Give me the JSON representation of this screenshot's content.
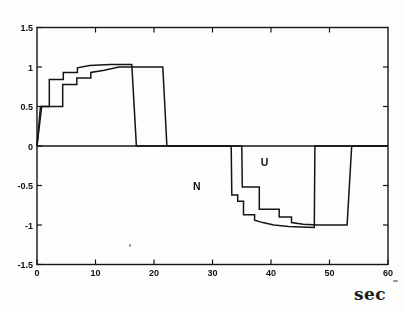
{
  "figure": {
    "xlabel": "sec"
  },
  "chart_data": {
    "type": "line",
    "title": "",
    "xlabel": "sec",
    "ylabel": "",
    "xlim": [
      0,
      60
    ],
    "ylim": [
      -1.5,
      1.5
    ],
    "grid": false,
    "legend_position": "none",
    "zero_line": true,
    "x_ticks": {
      "values": [
        0,
        10,
        20,
        30,
        40,
        50,
        60
      ],
      "labels": [
        "0",
        "10",
        "20",
        "30",
        "40",
        "50",
        "60"
      ]
    },
    "y_ticks": {
      "values": [
        1.5,
        1,
        0.5,
        0,
        -0.5,
        -1,
        -1.5
      ],
      "labels": [
        "1.5",
        "1",
        "0.5",
        "0",
        "-0.5",
        "-1",
        "-1.5"
      ]
    },
    "top_tick_values": [
      10,
      20,
      30,
      40,
      50
    ],
    "right_tick_values": [
      1,
      0.5,
      -0.5,
      -1
    ],
    "annotations": [
      {
        "text": "N",
        "x": 27.3,
        "y": -0.5
      },
      {
        "text": "U",
        "x": 38.9,
        "y": -0.2
      }
    ],
    "series": [
      {
        "name": "N",
        "points": [
          [
            0,
            0
          ],
          [
            0.6,
            0.5
          ],
          [
            2.1,
            0.5
          ],
          [
            2.1,
            0.84
          ],
          [
            4.5,
            0.84
          ],
          [
            4.5,
            0.93
          ],
          [
            6.9,
            0.93
          ],
          [
            6.9,
            0.99
          ],
          [
            9,
            1.02
          ],
          [
            12.5,
            1.03
          ],
          [
            16.2,
            1.03
          ],
          [
            17,
            0
          ],
          [
            33.2,
            0
          ],
          [
            33.3,
            -0.62
          ],
          [
            34.3,
            -0.62
          ],
          [
            34.3,
            -0.7
          ],
          [
            35.3,
            -0.7
          ],
          [
            35.3,
            -0.87
          ],
          [
            37.2,
            -0.87
          ],
          [
            37.2,
            -0.94
          ],
          [
            38.6,
            -0.97
          ],
          [
            40.5,
            -1.0
          ],
          [
            43,
            -1.02
          ],
          [
            47.4,
            -1.03
          ],
          [
            47.5,
            0
          ],
          [
            60,
            0
          ]
        ]
      },
      {
        "name": "U",
        "points": [
          [
            0,
            0
          ],
          [
            0.8,
            0.5
          ],
          [
            4.4,
            0.5
          ],
          [
            4.4,
            0.78
          ],
          [
            6.8,
            0.78
          ],
          [
            6.8,
            0.86
          ],
          [
            9.2,
            0.86
          ],
          [
            9.2,
            0.93
          ],
          [
            11.5,
            0.96
          ],
          [
            14,
            1.0
          ],
          [
            21.5,
            1.0
          ],
          [
            22.2,
            0
          ],
          [
            35,
            0
          ],
          [
            35.1,
            -0.52
          ],
          [
            38,
            -0.52
          ],
          [
            38,
            -0.8
          ],
          [
            41.4,
            -0.8
          ],
          [
            41.4,
            -0.9
          ],
          [
            43.5,
            -0.9
          ],
          [
            43.5,
            -0.97
          ],
          [
            45.5,
            -0.99
          ],
          [
            48,
            -1.0
          ],
          [
            53,
            -1.0
          ],
          [
            53.8,
            0
          ],
          [
            60,
            0
          ]
        ]
      }
    ],
    "style": {
      "line_color": "#1a1a1a",
      "background": "#fdfdfb"
    }
  }
}
